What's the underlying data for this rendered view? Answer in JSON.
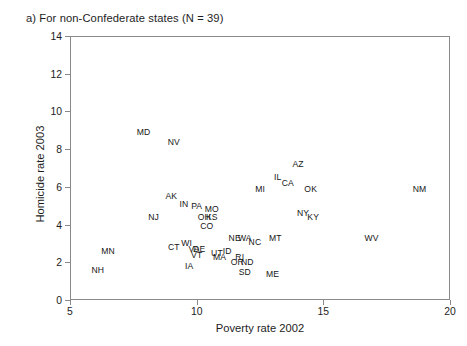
{
  "figure": {
    "panel_caption": "a) For non-Confederate states (N = 39)"
  },
  "chart_data": {
    "type": "scatter",
    "title": "a) For non-Confederate states (N = 39)",
    "xlabel": "Poverty rate 2002",
    "ylabel": "Homicide rate 2003",
    "xlim": [
      5,
      20
    ],
    "ylim": [
      0,
      14
    ],
    "xticks": [
      5,
      10,
      15,
      20
    ],
    "yticks": [
      0,
      2,
      4,
      6,
      8,
      10,
      12,
      14
    ],
    "grid": false,
    "legend": "none",
    "marker_style": "text-label-only",
    "n_points": 39,
    "points": [
      {
        "label": "MD",
        "x": 7.9,
        "y": 8.9
      },
      {
        "label": "NV",
        "x": 9.1,
        "y": 8.4
      },
      {
        "label": "AZ",
        "x": 14.0,
        "y": 7.2
      },
      {
        "label": "IL",
        "x": 13.2,
        "y": 6.5
      },
      {
        "label": "CA",
        "x": 13.6,
        "y": 6.2
      },
      {
        "label": "MI",
        "x": 12.5,
        "y": 5.9
      },
      {
        "label": "OK",
        "x": 14.5,
        "y": 5.9
      },
      {
        "label": "NM",
        "x": 18.8,
        "y": 5.9
      },
      {
        "label": "AK",
        "x": 9.0,
        "y": 5.5
      },
      {
        "label": "IN",
        "x": 9.5,
        "y": 5.1
      },
      {
        "label": "PA",
        "x": 10.0,
        "y": 5.0
      },
      {
        "label": "MO",
        "x": 10.6,
        "y": 4.8
      },
      {
        "label": "NY",
        "x": 14.2,
        "y": 4.6
      },
      {
        "label": "KY",
        "x": 14.6,
        "y": 4.4
      },
      {
        "label": "NJ",
        "x": 8.3,
        "y": 4.4
      },
      {
        "label": "OH",
        "x": 10.3,
        "y": 4.4
      },
      {
        "label": "KS",
        "x": 10.6,
        "y": 4.4
      },
      {
        "label": "CO",
        "x": 10.4,
        "y": 3.9
      },
      {
        "label": "NE",
        "x": 11.5,
        "y": 3.3
      },
      {
        "label": "WA",
        "x": 11.9,
        "y": 3.3
      },
      {
        "label": "MT",
        "x": 13.1,
        "y": 3.3
      },
      {
        "label": "WV",
        "x": 16.9,
        "y": 3.3
      },
      {
        "label": "WI",
        "x": 9.6,
        "y": 3.0
      },
      {
        "label": "CT",
        "x": 9.1,
        "y": 2.8
      },
      {
        "label": "VA",
        "x": 9.9,
        "y": 2.7
      },
      {
        "label": "DE",
        "x": 10.1,
        "y": 2.7
      },
      {
        "label": "MN",
        "x": 6.5,
        "y": 2.6
      },
      {
        "label": "UT",
        "x": 10.8,
        "y": 2.5
      },
      {
        "label": "MA",
        "x": 10.9,
        "y": 2.3
      },
      {
        "label": "RI",
        "x": 11.7,
        "y": 2.3
      },
      {
        "label": "OR",
        "x": 11.6,
        "y": 2.0
      },
      {
        "label": "ND",
        "x": 12.0,
        "y": 2.0
      },
      {
        "label": "IA",
        "x": 9.7,
        "y": 1.8
      },
      {
        "label": "NH",
        "x": 6.1,
        "y": 1.6
      },
      {
        "label": "SD",
        "x": 11.9,
        "y": 1.5
      },
      {
        "label": "ME",
        "x": 13.0,
        "y": 1.4
      },
      {
        "label": "ID",
        "x": 11.2,
        "y": 2.6
      },
      {
        "label": "VT",
        "x": 10.0,
        "y": 2.4
      },
      {
        "label": "NC",
        "x": 12.3,
        "y": 3.1
      }
    ]
  },
  "axes": {
    "x_tick_labels": [
      "5",
      "10",
      "15",
      "20"
    ],
    "y_tick_labels": [
      "0",
      "2",
      "4",
      "6",
      "8",
      "10",
      "12",
      "14"
    ]
  }
}
